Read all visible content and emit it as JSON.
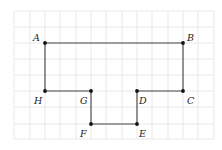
{
  "diagram": {
    "grid": {
      "x_lines": [
        14,
        30,
        45,
        60,
        76,
        91,
        106,
        122,
        137,
        152,
        168,
        183,
        198,
        214
      ],
      "y_lines": [
        11,
        27,
        43,
        59,
        75,
        91,
        107,
        124,
        139
      ],
      "color": "#e3e3e3"
    },
    "polygon_color": "#444444",
    "points": [
      {
        "name": "A",
        "x": 45,
        "y": 43,
        "lx": 33,
        "ly": 41
      },
      {
        "name": "B",
        "x": 183,
        "y": 43,
        "lx": 187,
        "ly": 41
      },
      {
        "name": "C",
        "x": 183,
        "y": 91,
        "lx": 187,
        "ly": 104
      },
      {
        "name": "D",
        "x": 137,
        "y": 91,
        "lx": 139,
        "ly": 104
      },
      {
        "name": "E",
        "x": 137,
        "y": 124,
        "lx": 139,
        "ly": 137
      },
      {
        "name": "F",
        "x": 91,
        "y": 124,
        "lx": 80,
        "ly": 137
      },
      {
        "name": "G",
        "x": 91,
        "y": 91,
        "lx": 80,
        "ly": 104
      },
      {
        "name": "H",
        "x": 45,
        "y": 91,
        "lx": 34,
        "ly": 104
      }
    ]
  }
}
